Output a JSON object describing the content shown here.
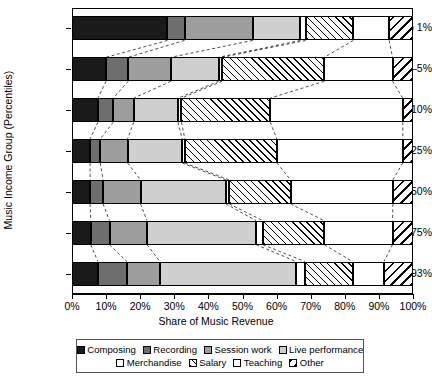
{
  "chart_data": {
    "type": "bar",
    "orientation": "horizontal",
    "stacked": true,
    "stacked_percent": true,
    "title": "",
    "xlabel": "Share of Music Revenue",
    "ylabel": "Music Income Group (Percentiles)",
    "xlim": [
      0,
      100
    ],
    "xticks": [
      "0%",
      "10%",
      "20%",
      "30%",
      "40%",
      "50%",
      "60%",
      "70%",
      "80%",
      "90%",
      "100%"
    ],
    "xtick_values": [
      0,
      10,
      20,
      30,
      40,
      50,
      60,
      70,
      80,
      90,
      100
    ],
    "grid": false,
    "legend_position": "bottom",
    "categories": [
      "Top 1%",
      "2–5%",
      "6–10%",
      "11–25%",
      "26–50%",
      "51–75%",
      "76–93%"
    ],
    "series": [
      {
        "name": "Composing",
        "values": [
          28.0,
          10.0,
          7.6,
          5.3,
          5.3,
          5.5,
          7.6
        ]
      },
      {
        "name": "Recording",
        "values": [
          5.0,
          6.5,
          4.5,
          3.0,
          3.8,
          5.5,
          8.5
        ]
      },
      {
        "name": "Session work",
        "values": [
          20.0,
          12.5,
          6.0,
          8.0,
          11.0,
          11.0,
          9.7
        ]
      },
      {
        "name": "Live performance",
        "values": [
          14.0,
          14.0,
          13.0,
          16.0,
          25.0,
          32.0,
          40.0
        ]
      },
      {
        "name": "Merchandise",
        "values": [
          1.5,
          1.0,
          1.0,
          0.8,
          1.0,
          2.0,
          2.5
        ]
      },
      {
        "name": "Salary",
        "values": [
          14.0,
          30.0,
          26.0,
          27.0,
          18.0,
          18.0,
          14.0
        ]
      },
      {
        "name": "Teaching",
        "values": [
          10.5,
          20.0,
          38.9,
          36.9,
          30.0,
          20.0,
          9.2
        ]
      },
      {
        "name": "Other",
        "values": [
          7.0,
          6.0,
          3.0,
          3.0,
          5.9,
          6.0,
          8.5
        ]
      }
    ],
    "legend_entries": [
      {
        "label": "Composing",
        "pattern": "solid-black"
      },
      {
        "label": "Recording",
        "pattern": "solid-dark-gray"
      },
      {
        "label": "Session work",
        "pattern": "solid-medium-gray"
      },
      {
        "label": "Live performance",
        "pattern": "solid-light-gray"
      },
      {
        "label": "Merchandise",
        "pattern": "dotted"
      },
      {
        "label": "Salary",
        "pattern": "forward-hatch"
      },
      {
        "label": "Teaching",
        "pattern": "crosshatch-checker"
      },
      {
        "label": "Other",
        "pattern": "back-hatch"
      }
    ],
    "colors": {
      "composing": "#1a1a1a",
      "recording": "#6e6e6e",
      "session": "#9d9d9d",
      "live": "#cfcfcf",
      "merchandise": "#ffffff",
      "salary": "#ffffff",
      "teaching": "#ffffff",
      "other": "#ffffff"
    }
  }
}
